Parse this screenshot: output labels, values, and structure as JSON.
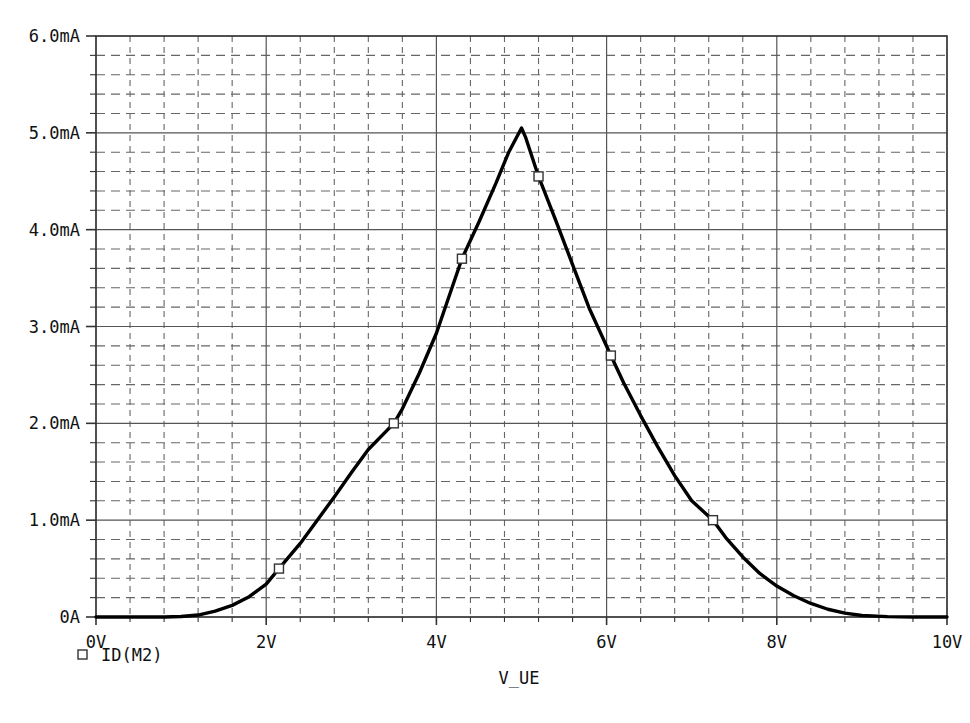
{
  "chart_data": {
    "type": "line",
    "title": "",
    "subtitle": "",
    "xlabel": "V_UE",
    "ylabel": "",
    "xlim": [
      0,
      10
    ],
    "ylim": [
      0,
      6
    ],
    "grid": true,
    "grid_major_x_step": 2,
    "grid_minor_x_step": 0.4,
    "grid_major_y_step": 1,
    "grid_minor_y_step": 0.2,
    "x_unit": "V",
    "y_unit": "mA",
    "legend_position": "below-left",
    "x_tick_labels": [
      "0V",
      "2V",
      "4V",
      "6V",
      "8V",
      "10V"
    ],
    "x_tick_values": [
      0,
      2,
      4,
      6,
      8,
      10
    ],
    "y_tick_labels": [
      "0A",
      "1.0mA",
      "2.0mA",
      "3.0mA",
      "4.0mA",
      "5.0mA",
      "6.0mA"
    ],
    "y_tick_values": [
      0,
      1,
      2,
      3,
      4,
      5,
      6
    ],
    "series": [
      {
        "name": "ID(M2)",
        "color": "#000000",
        "marker": "square-open",
        "points": [
          [
            0.0,
            0.0
          ],
          [
            0.4,
            0.0
          ],
          [
            0.8,
            0.0
          ],
          [
            1.0,
            0.005
          ],
          [
            1.2,
            0.02
          ],
          [
            1.4,
            0.06
          ],
          [
            1.6,
            0.12
          ],
          [
            1.8,
            0.21
          ],
          [
            2.0,
            0.34
          ],
          [
            2.15,
            0.5
          ],
          [
            2.4,
            0.76
          ],
          [
            2.6,
            1.0
          ],
          [
            2.8,
            1.24
          ],
          [
            3.0,
            1.49
          ],
          [
            3.2,
            1.73
          ],
          [
            3.5,
            2.0
          ],
          [
            3.6,
            2.15
          ],
          [
            3.8,
            2.52
          ],
          [
            4.0,
            2.93
          ],
          [
            4.3,
            3.7
          ],
          [
            4.5,
            4.08
          ],
          [
            4.7,
            4.48
          ],
          [
            4.85,
            4.8
          ],
          [
            5.0,
            5.05
          ],
          [
            5.05,
            4.95
          ],
          [
            5.2,
            4.55
          ],
          [
            5.4,
            4.1
          ],
          [
            5.6,
            3.64
          ],
          [
            5.8,
            3.18
          ],
          [
            6.05,
            2.7
          ],
          [
            6.2,
            2.42
          ],
          [
            6.4,
            2.08
          ],
          [
            6.6,
            1.76
          ],
          [
            6.8,
            1.46
          ],
          [
            7.0,
            1.2
          ],
          [
            7.25,
            1.0
          ],
          [
            7.4,
            0.82
          ],
          [
            7.6,
            0.62
          ],
          [
            7.8,
            0.45
          ],
          [
            8.0,
            0.32
          ],
          [
            8.2,
            0.22
          ],
          [
            8.4,
            0.14
          ],
          [
            8.6,
            0.08
          ],
          [
            8.8,
            0.04
          ],
          [
            9.0,
            0.015
          ],
          [
            9.3,
            0.004
          ],
          [
            9.6,
            0.0
          ],
          [
            10.0,
            0.0
          ]
        ],
        "marker_points": [
          [
            2.15,
            0.5
          ],
          [
            3.5,
            2.0
          ],
          [
            4.3,
            3.7
          ],
          [
            5.2,
            4.55
          ],
          [
            6.05,
            2.7
          ],
          [
            7.25,
            1.0
          ]
        ],
        "peak": {
          "x": 5.0,
          "y": 5.05
        }
      }
    ]
  },
  "legend": {
    "entries": [
      {
        "label": "ID(M2)",
        "marker": "square-open"
      }
    ]
  },
  "axis": {
    "x_title": "V_UE"
  },
  "colors": {
    "curve": "#000000",
    "major_grid": "#555555",
    "minor_grid": "#666666",
    "frame": "#333333",
    "text": "#111111",
    "background": "#ffffff"
  }
}
